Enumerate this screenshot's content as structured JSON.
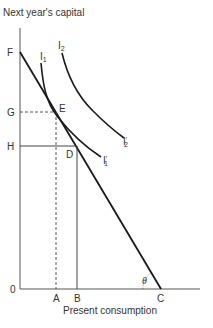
{
  "axes": {
    "y_label": "Next year's capital",
    "x_label": "Present consumption",
    "origin": "0"
  },
  "points": {
    "F": "F",
    "G": "G",
    "H": "H",
    "E": "E",
    "D": "D",
    "A": "A",
    "B": "B",
    "C": "C"
  },
  "curves": {
    "I1": {
      "base": "I",
      "sub": "1"
    },
    "I1_prime": {
      "base": "I",
      "sup": "′",
      "sub": "1"
    },
    "I2": {
      "base": "I",
      "sub": "2"
    },
    "I2_prime": {
      "base": "I",
      "sup": "′",
      "sub": "2"
    }
  },
  "angle_label": "θ",
  "colors": {
    "line": "#1a1a1a",
    "axis": "#555555",
    "text": "#333333"
  }
}
